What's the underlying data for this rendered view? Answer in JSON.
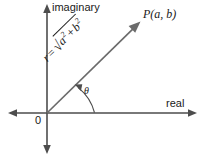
{
  "figure": {
    "width": 205,
    "height": 158,
    "background_color": "#ffffff",
    "axis_color": "#4d4d4d",
    "ray_color": "#6b6b6b",
    "text_color": "#1a1a1a"
  },
  "axes": {
    "vertical_label": "imaginary",
    "horizontal_label": "real",
    "origin_label": "0",
    "origin_px": {
      "x": 47,
      "y": 113
    }
  },
  "point": {
    "label": "P(a, b)",
    "px": {
      "x": 140,
      "y": 22
    }
  },
  "angle": {
    "symbol": "θ",
    "degrees": 44
  },
  "magnitude": {
    "variable": "r",
    "equals": "=",
    "radical": "√",
    "term_a": "a",
    "term_a_exponent": "2",
    "operator": "+",
    "term_b": "b",
    "term_b_exponent": "2",
    "expression": "r = √(a² + b²)"
  }
}
